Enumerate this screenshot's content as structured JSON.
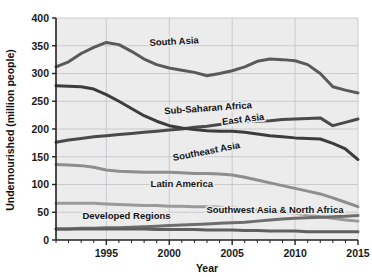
{
  "chart_data": {
    "type": "line",
    "title": "",
    "xlabel": "Year",
    "ylabel": "Undernourished (million people)",
    "xlim": [
      1991,
      2015
    ],
    "ylim": [
      0,
      400
    ],
    "xticks": [
      1995,
      2000,
      2005,
      2010,
      2015
    ],
    "yticks": [
      0,
      50,
      100,
      150,
      200,
      250,
      300,
      350,
      400
    ],
    "grid": true,
    "legend_position": "inline-labels",
    "x": [
      1991,
      1992,
      1993,
      1994,
      1995,
      1996,
      1997,
      1998,
      1999,
      2000,
      2001,
      2002,
      2003,
      2004,
      2005,
      2006,
      2007,
      2008,
      2009,
      2010,
      2011,
      2012,
      2013,
      2014,
      2015
    ],
    "series": [
      {
        "name": "South Asia",
        "color": "#5a5a5a",
        "label_x": 2000.4,
        "label_y": 352,
        "label_rotate": -3,
        "values": [
          312,
          321,
          336,
          347,
          356,
          352,
          340,
          326,
          316,
          310,
          306,
          302,
          296,
          300,
          305,
          312,
          322,
          326,
          325,
          323,
          316,
          300,
          276,
          270,
          265
        ]
      },
      {
        "name": "Sub-Saharan Africa",
        "color": "#4a4a4a",
        "label_x": 2003.1,
        "label_y": 232,
        "label_rotate": -4,
        "values": [
          176,
          180,
          183,
          186,
          188,
          190,
          192,
          194,
          196,
          198,
          200,
          203,
          205,
          208,
          211,
          213,
          214,
          215,
          217,
          218,
          219,
          220,
          206,
          212,
          218
        ]
      },
      {
        "name": "East Asia",
        "color": "#3c3c3c",
        "label_x": 2005.9,
        "label_y": 212,
        "label_rotate": -7,
        "values": [
          278,
          277,
          276,
          272,
          262,
          250,
          237,
          224,
          214,
          206,
          202,
          199,
          197,
          196,
          196,
          194,
          191,
          188,
          186,
          184,
          183,
          182,
          174,
          164,
          145
        ]
      },
      {
        "name": "Southeast Asia",
        "color": "#8e8e8e",
        "label_x": 2003.0,
        "label_y": 154,
        "label_rotate": -11,
        "values": [
          136,
          135,
          134,
          131,
          126,
          124,
          123,
          122,
          122,
          122,
          121,
          120,
          120,
          119,
          117,
          113,
          108,
          103,
          98,
          93,
          88,
          83,
          76,
          68,
          60
        ]
      },
      {
        "name": "Latin America",
        "color": "#9a9a9a",
        "label_x": 2001.0,
        "label_y": 95,
        "label_rotate": 0,
        "values": [
          66,
          66,
          66,
          66,
          65,
          64,
          63,
          62,
          62,
          61,
          61,
          60,
          60,
          59,
          58,
          56,
          54,
          52,
          50,
          48,
          45,
          42,
          39,
          36,
          34
        ]
      },
      {
        "name": "Southwest Asia & North Africa",
        "color": "#6e6e6e",
        "label_x": 2008.4,
        "label_y": 48,
        "label_rotate": 0,
        "values": [
          20,
          20,
          21,
          21,
          22,
          22,
          23,
          24,
          25,
          26,
          27,
          28,
          29,
          30,
          31,
          32,
          34,
          36,
          38,
          39,
          40,
          41,
          42,
          43,
          44
        ]
      },
      {
        "name": "Developed Regions",
        "color": "#5f5f5f",
        "label_x": 1996.6,
        "label_y": 38,
        "label_rotate": 0,
        "values": [
          20,
          20,
          20,
          20,
          20,
          20,
          20,
          20,
          19,
          19,
          19,
          19,
          18,
          18,
          18,
          17,
          17,
          16,
          16,
          16,
          15,
          15,
          15,
          15,
          15
        ]
      }
    ]
  },
  "colors": {
    "plot_background": "#ececec",
    "grid": "#c3c3c6",
    "axis": "#222222",
    "text": "#111111"
  }
}
